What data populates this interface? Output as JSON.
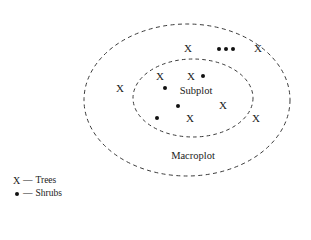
{
  "figure": {
    "regions": [
      {
        "id": "macroplot",
        "label": "Macroplot",
        "shape": "dashed-ellipse",
        "cx": 187,
        "cy": 100,
        "rx": 103,
        "ry": 76,
        "label_x": 193,
        "label_y": 155
      },
      {
        "id": "subplot",
        "label": "Subplot",
        "shape": "dashed-ellipse",
        "cx": 193,
        "cy": 98,
        "rx": 60,
        "ry": 39,
        "label_x": 196,
        "label_y": 90
      }
    ],
    "markers": [
      {
        "type": "tree",
        "glyph": "X",
        "x": 188,
        "y": 48,
        "region": "macroplot"
      },
      {
        "type": "shrub",
        "glyph": "•",
        "x": 219,
        "y": 49,
        "region": "macroplot"
      },
      {
        "type": "shrub",
        "glyph": "•",
        "x": 226,
        "y": 49,
        "region": "macroplot"
      },
      {
        "type": "shrub",
        "glyph": "•",
        "x": 233,
        "y": 49,
        "region": "macroplot"
      },
      {
        "type": "tree",
        "glyph": "X",
        "x": 258,
        "y": 48,
        "region": "macroplot"
      },
      {
        "type": "tree",
        "glyph": "X",
        "x": 120,
        "y": 88,
        "region": "macroplot"
      },
      {
        "type": "tree",
        "glyph": "X",
        "x": 160,
        "y": 76,
        "region": "subplot"
      },
      {
        "type": "tree",
        "glyph": "X",
        "x": 191,
        "y": 76,
        "region": "subplot"
      },
      {
        "type": "shrub",
        "glyph": "•",
        "x": 203,
        "y": 76,
        "region": "subplot"
      },
      {
        "type": "shrub",
        "glyph": "•",
        "x": 165,
        "y": 88,
        "region": "subplot"
      },
      {
        "type": "shrub",
        "glyph": "•",
        "x": 178,
        "y": 106,
        "region": "subplot"
      },
      {
        "type": "tree",
        "glyph": "X",
        "x": 223,
        "y": 105,
        "region": "subplot"
      },
      {
        "type": "shrub",
        "glyph": "•",
        "x": 157,
        "y": 118,
        "region": "subplot"
      },
      {
        "type": "tree",
        "glyph": "X",
        "x": 190,
        "y": 118,
        "region": "subplot"
      },
      {
        "type": "tree",
        "glyph": "X",
        "x": 256,
        "y": 118,
        "region": "macroplot"
      }
    ],
    "counts": {
      "trees_in_subplot": 4,
      "shrubs_in_subplot": 4,
      "trees_in_macroplot_only": 3,
      "shrubs_in_macroplot_only": 3
    }
  },
  "legend": {
    "entries": [
      {
        "symbol": "X",
        "symbol_name": "tree-symbol",
        "dash": "—",
        "label": "Trees"
      },
      {
        "symbol": "•",
        "symbol_name": "shrub-symbol",
        "dash": "—",
        "label": "Shrubs"
      }
    ]
  },
  "style": {
    "stroke_color": "#3a3a3a",
    "marker_color": "#111111",
    "text_color": "#1a1a1a",
    "background": "#ffffff"
  }
}
